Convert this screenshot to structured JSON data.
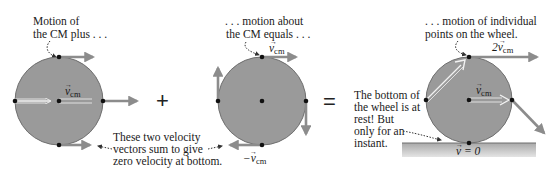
{
  "colors": {
    "wheel_fill": "#9a9a9a",
    "wheel_stroke": "#6e6e6e",
    "arrow_gray": "#8c8c8c",
    "arrow_outline_white": "#f2f2f2",
    "ground": "#b8b8b8",
    "dot": "#111111",
    "text": "#1a1a1a"
  },
  "panels": [
    {
      "id": "translation",
      "caption_line1": "Motion of",
      "caption_line2": "the CM plus . . .",
      "vector_label": "v",
      "vector_sub": "cm"
    },
    {
      "id": "rotation",
      "caption_line1": ". . . motion about",
      "caption_line2": "the CM equals . . .",
      "top_label": "v",
      "top_sub": "cm",
      "bottom_label": "−v",
      "bottom_sub": "cm"
    },
    {
      "id": "rolling",
      "caption_line1": ". . . motion of individual",
      "caption_line2": "points on the wheel.",
      "top_label": "2v",
      "top_sub": "cm",
      "center_label": "v",
      "center_sub": "cm",
      "bottom_label": "v = 0"
    }
  ],
  "operators": {
    "plus": "+",
    "equals": "="
  },
  "annotations": {
    "sum_note_line1": "These two velocity",
    "sum_note_line2": "vectors sum to give",
    "sum_note_line3": "zero velocity at bottom.",
    "rest_note_line1": "The bottom of",
    "rest_note_line2": "the wheel is at",
    "rest_note_line3": "rest!  But",
    "rest_note_line4": "only for an",
    "rest_note_line5": "instant."
  }
}
